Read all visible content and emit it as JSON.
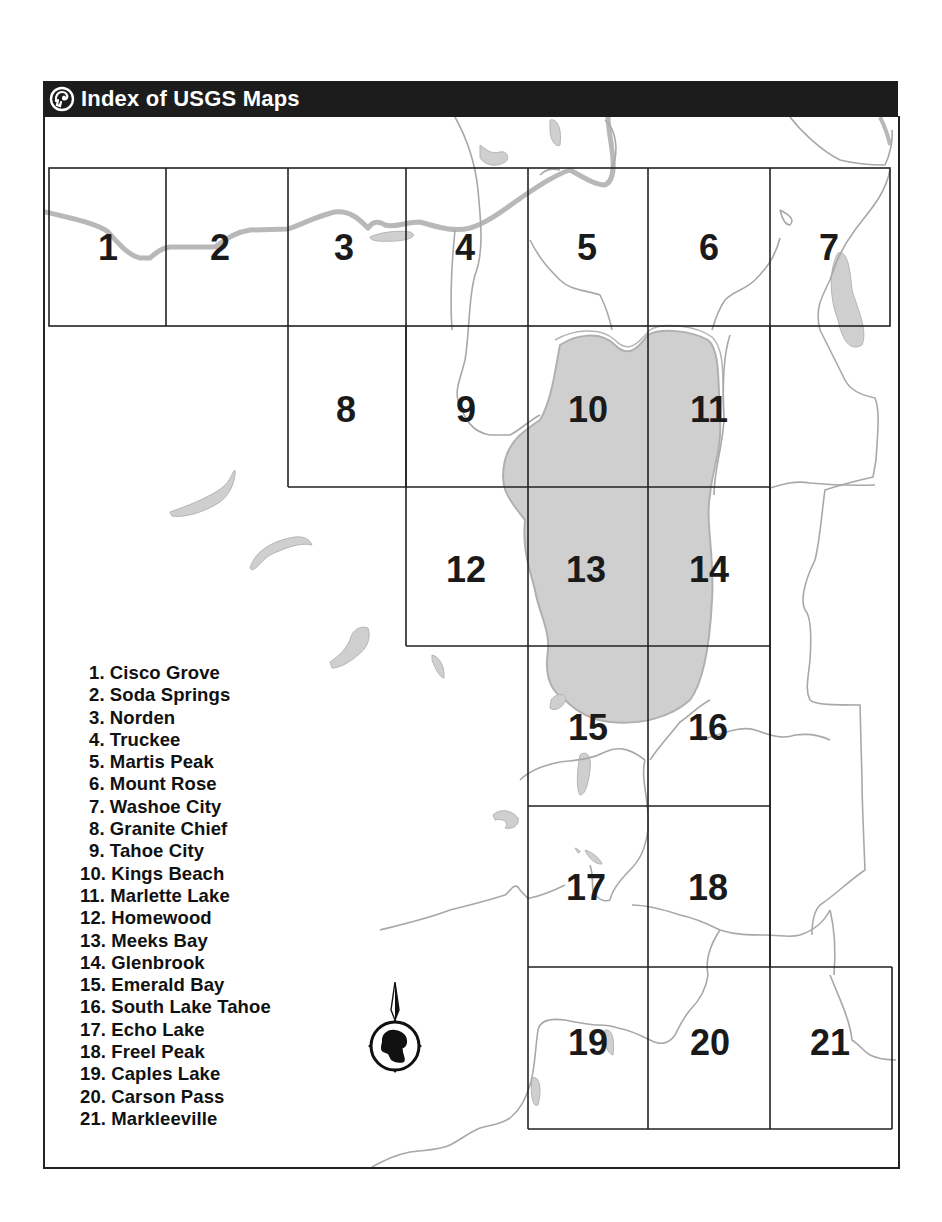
{
  "header": {
    "title": "Index of USGS Maps",
    "icon": "ram-head-logo-icon"
  },
  "colors": {
    "header_bg": "#1c1c1c",
    "water": "#cfcfcf",
    "road": "#b8b8b8",
    "boundary": "#a8a8a8",
    "grid": "#222222"
  },
  "quads": [
    {
      "number": "1",
      "name": "Cisco Grove"
    },
    {
      "number": "2",
      "name": "Soda Springs"
    },
    {
      "number": "3",
      "name": "Norden"
    },
    {
      "number": "4",
      "name": "Truckee"
    },
    {
      "number": "5",
      "name": "Martis Peak"
    },
    {
      "number": "6",
      "name": "Mount Rose"
    },
    {
      "number": "7",
      "name": "Washoe City"
    },
    {
      "number": "8",
      "name": "Granite Chief"
    },
    {
      "number": "9",
      "name": "Tahoe City"
    },
    {
      "number": "10",
      "name": "Kings Beach"
    },
    {
      "number": "11",
      "name": "Marlette Lake"
    },
    {
      "number": "12",
      "name": "Homewood"
    },
    {
      "number": "13",
      "name": "Meeks Bay"
    },
    {
      "number": "14",
      "name": "Glenbrook"
    },
    {
      "number": "15",
      "name": "Emerald Bay"
    },
    {
      "number": "16",
      "name": "South Lake Tahoe"
    },
    {
      "number": "17",
      "name": "Echo Lake"
    },
    {
      "number": "18",
      "name": "Freel Peak"
    },
    {
      "number": "19",
      "name": "Caples Lake"
    },
    {
      "number": "20",
      "name": "Carson Pass"
    },
    {
      "number": "21",
      "name": "Markleeville"
    }
  ],
  "legend": [
    "1. Cisco Grove",
    "2. Soda Springs",
    "3. Norden",
    "4. Truckee",
    "5. Martis Peak",
    "6. Mount Rose",
    "7. Washoe City",
    "8. Granite Chief",
    "9. Tahoe City",
    "10. Kings Beach",
    "11. Marlette Lake",
    "12. Homewood",
    "13. Meeks Bay",
    "14. Glenbrook",
    "15. Emerald Bay",
    "16. South Lake Tahoe",
    "17. Echo Lake",
    "18. Freel Peak",
    "19. Caples Lake",
    "20. Carson Pass",
    "21. Markleeville"
  ],
  "compass": {
    "icon": "north-arrow-compass-icon",
    "direction": "N"
  }
}
